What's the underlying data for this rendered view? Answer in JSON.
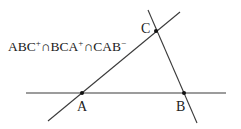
{
  "diagram": {
    "type": "geometry-figure",
    "expression": {
      "parts": [
        {
          "text": "ABC",
          "sup": "+"
        },
        {
          "text": "∩BCA",
          "sup": "+"
        },
        {
          "text": "∩CAB",
          "sup": "−"
        }
      ]
    },
    "points": [
      {
        "id": "A",
        "label": "A"
      },
      {
        "id": "B",
        "label": "B"
      },
      {
        "id": "C",
        "label": "C"
      }
    ],
    "lines": [
      {
        "id": "line-AB",
        "through": [
          "A",
          "B"
        ]
      },
      {
        "id": "line-AC",
        "through": [
          "A",
          "C"
        ]
      },
      {
        "id": "line-BC",
        "through": [
          "B",
          "C"
        ]
      }
    ]
  }
}
